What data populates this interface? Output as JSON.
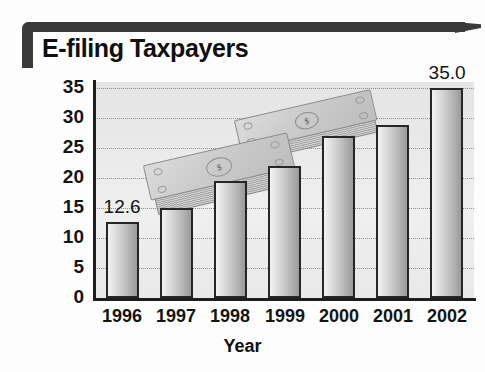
{
  "title": "E-filing Taxpayers",
  "chart_data": {
    "type": "bar",
    "title": "E-filing Taxpayers",
    "xlabel": "Year",
    "ylabel": "Percent",
    "categories": [
      "1996",
      "1997",
      "1998",
      "1999",
      "2000",
      "2001",
      "2002"
    ],
    "values": [
      12.6,
      15.0,
      19.5,
      22.0,
      27.0,
      28.8,
      35.0
    ],
    "data_labels": {
      "1996": "12.6",
      "2002": "35.0"
    },
    "ylim": [
      0,
      35
    ],
    "ytick_labels": [
      "0",
      "5",
      "10",
      "15",
      "20",
      "25",
      "30",
      "35"
    ],
    "ytick_values": [
      0,
      5,
      10,
      15,
      20,
      25,
      30,
      35
    ],
    "grid": true,
    "gridstyle": "dotted-horizontal",
    "legend": "none",
    "annotations": [
      "stacks of dollar bills illustrated behind the bars"
    ],
    "colors": {
      "bar_fill_light": "#f2f2f2",
      "bar_fill_dark": "#9a9a9a",
      "bar_border": "#262626",
      "plot_background": "#ebebeb",
      "axis": "#1e1e1e",
      "frame": "#3a3a3a",
      "text": "#141414"
    }
  },
  "decorations": {
    "bill_symbol": "$"
  }
}
